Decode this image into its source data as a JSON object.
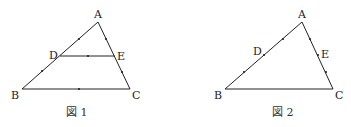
{
  "figures": [
    {
      "caption": "図 1",
      "points": {
        "A": {
          "label": "A",
          "x": 98,
          "y": 22
        },
        "B": {
          "label": "B",
          "x": 22,
          "y": 89
        },
        "C": {
          "label": "C",
          "x": 130,
          "y": 89
        },
        "D": {
          "label": "D",
          "x": 60,
          "y": 56
        },
        "E": {
          "label": "E",
          "x": 115,
          "y": 56
        }
      },
      "segments": [
        "AB",
        "BC",
        "CA",
        "DE"
      ]
    },
    {
      "caption": "図 2",
      "points": {
        "A": {
          "label": "A",
          "x": 302,
          "y": 22
        },
        "B": {
          "label": "B",
          "x": 225,
          "y": 89
        },
        "C": {
          "label": "C",
          "x": 333,
          "y": 89
        },
        "D": {
          "label": "D",
          "x": 264,
          "y": 55
        },
        "E": {
          "label": "E",
          "x": 318,
          "y": 55
        }
      },
      "segments": [
        "AB",
        "BC",
        "CA"
      ]
    }
  ],
  "colors": {
    "line": "#222222",
    "text": "#222222"
  }
}
